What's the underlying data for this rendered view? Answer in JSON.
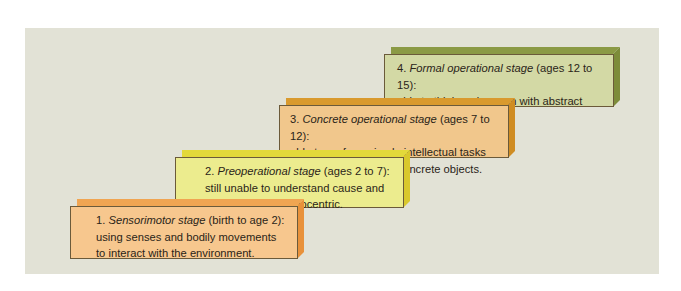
{
  "diagram": {
    "type": "staircase",
    "steps": [
      {
        "number": "1.",
        "name": "Sensorimotor stage",
        "ages": "(birth to age 2):",
        "description_lines": [
          "using senses and bodily movements",
          "to interact with the environment."
        ],
        "colors": {
          "face": "#f7c78e",
          "top": "#f0a552",
          "side": "#e8913a"
        }
      },
      {
        "number": "2.",
        "name": "Preoperational stage",
        "ages": "(ages 2 to 7):",
        "description_lines": [
          "still unable to understand cause and",
          "effect; animistic; egocentric."
        ],
        "colors": {
          "face": "#ecec8e",
          "top": "#e3d93a",
          "side": "#d9c82c"
        }
      },
      {
        "number": "3.",
        "name": "Concrete operational stage",
        "ages": "(ages 7 to 12):",
        "description_lines": [
          "able to perform simple intellectual tasks",
          "involving only visible, concrete objects."
        ],
        "colors": {
          "face": "#f1c78c",
          "top": "#d99a2e",
          "side": "#cf8c22"
        }
      },
      {
        "number": "4.",
        "name": "Formal operational stage",
        "ages": "(ages 12 to 15):",
        "description_lines": [
          "able to think and reason with abstract",
          "concepts."
        ],
        "colors": {
          "face": "#d3d9a5",
          "top": "#8b9a45",
          "side": "#7d8c3a"
        }
      }
    ]
  }
}
